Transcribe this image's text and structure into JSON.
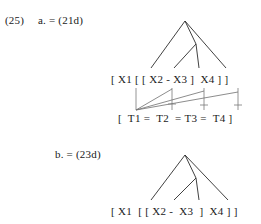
{
  "example": {
    "number": "(25)",
    "items": [
      {
        "id": "a",
        "label": "a. = (21d)",
        "bracket_string": "[ X1 [ [ X2 - X3 ]  X4 ] ]",
        "tier_string": "[  T1 =  T2  = T3 =  T4 ]",
        "has_association_lines": true
      },
      {
        "id": "b",
        "label": "b. = (23d)",
        "bracket_string": "[ X1  [ [ X2 -  X3  ]  X4 ] ]",
        "tier_string": "",
        "has_association_lines": false
      }
    ]
  },
  "tree_a": {
    "nodes": [
      "X1",
      "X2",
      "X3",
      "X4"
    ],
    "apex": {
      "x": 185,
      "y": 21
    },
    "inner_node": {
      "x": 196,
      "y": 44
    },
    "leaves": [
      {
        "label": "X1",
        "x": 151,
        "y": 70
      },
      {
        "label": "X2",
        "x": 174,
        "y": 70
      },
      {
        "label": "X3",
        "x": 197,
        "y": 70
      },
      {
        "label": "X4",
        "x": 226,
        "y": 70
      }
    ]
  },
  "tree_b": {
    "nodes": [
      "X1",
      "X2",
      "X3",
      "X4"
    ],
    "apex": {
      "x": 185,
      "y": 155
    },
    "inner_node": {
      "x": 196,
      "y": 178
    },
    "leaves": [
      {
        "label": "X1",
        "x": 151,
        "y": 202
      },
      {
        "label": "X2",
        "x": 174,
        "y": 202
      },
      {
        "label": "X3",
        "x": 197,
        "y": 202
      },
      {
        "label": "X4",
        "x": 226,
        "y": 202
      }
    ]
  },
  "association_a": {
    "anchor": {
      "x": 136,
      "y": 110
    },
    "drop_lines_x": [
      136,
      172,
      204,
      238
    ],
    "top_y": 88,
    "bottom_y": 110
  },
  "colors": {
    "background": "#ffffff",
    "text": "#1a1a1a",
    "tree_stroke": "#2b2b2b",
    "assoc_stroke": "#6f6f6f"
  }
}
